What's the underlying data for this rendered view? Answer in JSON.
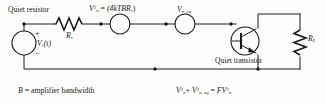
{
  "diagram": {
    "type": "circuit-schematic",
    "ink_color": "#1a1a1a",
    "paper_color": "#fdfdfb"
  },
  "labels": {
    "quiet_resistor": "Quiet resistor",
    "quiet_transistor": "Quiet transistor",
    "source_label": "V",
    "source_sub": "s",
    "source_arg": "(t)",
    "plus_sign": "+",
    "minus_sign": "−",
    "rs_label": "R",
    "rs_sub": "s",
    "rl_label": "R",
    "rl_sub": "L",
    "veq_label": "V",
    "veq_sub": "n, eq"
  },
  "equations": {
    "thermal_noise": {
      "lhs_v": "V",
      "lhs_sub": "n",
      "lhs_sup": "2",
      "eq": "=",
      "rhs": "(4kTBR",
      "rhs_sub": "s",
      "rhs_close": ")"
    },
    "bandwidth": {
      "symbol": "B",
      "eq": "=",
      "text": "amplifier bandwidth"
    },
    "noise_figure": {
      "term1_v": "V",
      "term1_sub": "n",
      "term1_sup": "2",
      "plus": "+",
      "term2_v": "V",
      "term2_sub": "n, eq",
      "term2_sup": "2",
      "eq": "=",
      "rhs_f": "F",
      "rhs_v": "V",
      "rhs_sub": "n",
      "rhs_sup": "2"
    }
  },
  "components": [
    {
      "id": "source-vs",
      "kind": "voltage-source",
      "label": "Vs(t)"
    },
    {
      "id": "resistor-rs",
      "kind": "resistor",
      "label": "Rs"
    },
    {
      "id": "source-vn",
      "kind": "noise-source",
      "label": "Vn^2 = (4kTBRs)"
    },
    {
      "id": "source-vn-eq",
      "kind": "noise-source",
      "label": "Vn, eq"
    },
    {
      "id": "transistor-q1",
      "kind": "npn-bjt",
      "label": "Quiet transistor"
    },
    {
      "id": "resistor-rl",
      "kind": "resistor",
      "label": "RL"
    }
  ]
}
